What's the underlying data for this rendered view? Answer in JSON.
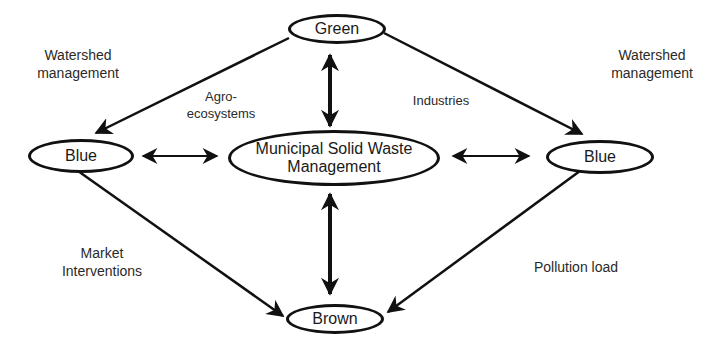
{
  "nodes": {
    "green": "Green",
    "blue_left": "Blue",
    "blue_right": "Blue",
    "center": "Municipal Solid Waste Management",
    "brown": "Brown"
  },
  "labels": {
    "watershed_left": "Watershed management",
    "watershed_right": "Watershed management",
    "agro": "Agro- ecosystems",
    "industries": "Industries",
    "market": "Market Interventions",
    "pollution": "Pollution load"
  },
  "edges": [
    {
      "from": "Green",
      "to": "Blue (left)",
      "type": "directed"
    },
    {
      "from": "Green",
      "to": "Blue (right)",
      "type": "directed"
    },
    {
      "from": "Blue (left)",
      "to": "Brown",
      "type": "directed"
    },
    {
      "from": "Blue (right)",
      "to": "Brown",
      "type": "directed"
    },
    {
      "from": "Green",
      "to": "Municipal Solid Waste Management",
      "type": "bidirectional"
    },
    {
      "from": "Brown",
      "to": "Municipal Solid Waste Management",
      "type": "bidirectional"
    },
    {
      "from": "Blue (left)",
      "to": "Municipal Solid Waste Management",
      "type": "bidirectional"
    },
    {
      "from": "Blue (right)",
      "to": "Municipal Solid Waste Management",
      "type": "bidirectional"
    }
  ],
  "colors": {
    "stroke": "#111111",
    "text": "#1a1a1a",
    "background": "#ffffff"
  }
}
